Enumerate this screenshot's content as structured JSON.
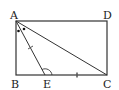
{
  "diagram": {
    "type": "geometry",
    "title": "",
    "colors": {
      "stroke": "#333333",
      "background": "#ffffff"
    },
    "points": {
      "A": {
        "label": "A",
        "x": 16,
        "y": 21
      },
      "B": {
        "label": "B",
        "x": 16,
        "y": 75
      },
      "C": {
        "label": "C",
        "x": 107,
        "y": 75
      },
      "D": {
        "label": "D",
        "x": 107,
        "y": 21
      },
      "E": {
        "label": "E",
        "x": 45,
        "y": 75
      }
    },
    "shapes": [
      "rectangle ABCD",
      "segment AE",
      "segment AC"
    ],
    "marks": {
      "equal_ticks": [
        "AE",
        "EC"
      ],
      "equal_angles_at_A": [
        "BAE",
        "EAC"
      ],
      "angle_arc_at_E": "AEC"
    }
  }
}
